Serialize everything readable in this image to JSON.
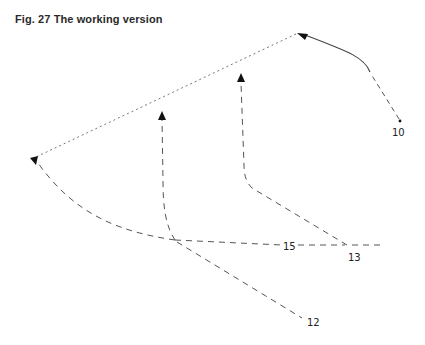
{
  "figure": {
    "title": "Fig. 27 The working version"
  },
  "colors": {
    "line": "#555555",
    "dotted": "#777777",
    "arrowhead": "#111111",
    "text": "#222222"
  },
  "points": {
    "p10": {
      "label": "10",
      "x": 400,
      "y": 121
    },
    "p12": {
      "label": "12",
      "x": 301,
      "y": 318
    },
    "p13": {
      "label": "13",
      "x": 348,
      "y": 245
    },
    "p15": {
      "label": "15",
      "x": 288,
      "y": 246
    }
  },
  "labels": [
    {
      "id": "label-10",
      "text": "10",
      "x": 392,
      "y": 135
    },
    {
      "id": "label-12",
      "text": "12",
      "x": 307,
      "y": 325
    },
    {
      "id": "label-13",
      "text": "13",
      "x": 349,
      "y": 259
    },
    {
      "id": "label-15",
      "text": "15",
      "x": 284,
      "y": 250
    }
  ]
}
